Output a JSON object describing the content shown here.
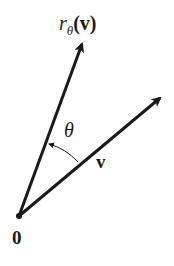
{
  "figure": {
    "labels": {
      "rotated_vector_r": "r",
      "rotated_vector_sub": "θ",
      "rotated_vector_arg": "(v)",
      "angle": "θ",
      "vector": "v",
      "origin": "0"
    },
    "colors": {
      "stroke": "#1a1a1a",
      "background": "#ffffff"
    }
  }
}
